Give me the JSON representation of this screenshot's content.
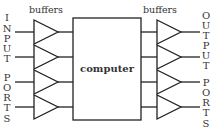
{
  "diagram": {
    "center_label": "computer",
    "left_header": "buffers",
    "right_header": "buffers",
    "left_side_label": [
      "I",
      "N",
      "P",
      "U",
      "T",
      " ",
      "P",
      "O",
      "R",
      "T",
      "S"
    ],
    "right_side_label": [
      "O",
      "U",
      "T",
      "P",
      "U",
      "T",
      " ",
      "P",
      "O",
      "R",
      "T",
      "S"
    ],
    "left_side_text": "INPUT PORTS",
    "right_side_text": "OUTPUT PORTS",
    "buffer_count_per_side": 4
  }
}
